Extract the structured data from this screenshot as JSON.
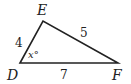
{
  "diagram": {
    "type": "triangle",
    "vertices": [
      {
        "name": "D",
        "x": 20,
        "y": 63
      },
      {
        "name": "E",
        "x": 43,
        "y": 21
      },
      {
        "name": "F",
        "x": 118,
        "y": 63
      }
    ],
    "sides": [
      {
        "from": "D",
        "to": "E",
        "label": "4"
      },
      {
        "from": "E",
        "to": "F",
        "label": "5"
      },
      {
        "from": "D",
        "to": "F",
        "label": "7"
      }
    ],
    "angle": {
      "vertex": "D",
      "label": "x°"
    },
    "stroke_color": "#222222"
  }
}
